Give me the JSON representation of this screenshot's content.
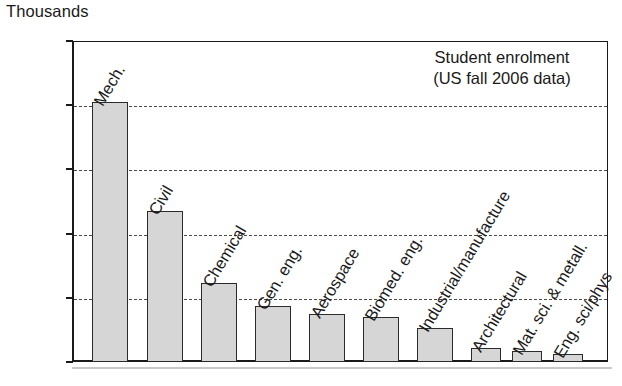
{
  "chart_data": {
    "type": "bar",
    "title": "",
    "xlabel": "",
    "ylabel": "Thousands",
    "ylim": [
      0,
      100
    ],
    "yticks": [
      0,
      20,
      40,
      60,
      80,
      100
    ],
    "grid": true,
    "grid_style": "dashed horizontal",
    "legend": "none",
    "annotations": [
      "Student enrolment",
      "(US fall 2006 data)"
    ],
    "categories": [
      "Mech.",
      "Civil",
      "Chemical",
      "Gen. eng.",
      "Aerospace",
      "Biomed. eng.",
      "Industrial/manufacture",
      "Architectural",
      "Mat. sci. & metall.",
      "Eng. sci/phys"
    ],
    "values": [
      81,
      47,
      24.5,
      17.5,
      15,
      14,
      10.5,
      4.5,
      3.5,
      2.5
    ],
    "bar_fill": "#d6d6d6",
    "bar_edge": "#2b2b2b"
  },
  "axis": {
    "unit_label": "Thousands",
    "tick_labels": [
      "100",
      "80",
      "60",
      "40",
      "20",
      "0"
    ]
  },
  "annotation": {
    "line1": "Student enrolment",
    "line2": "(US fall 2006 data)"
  }
}
